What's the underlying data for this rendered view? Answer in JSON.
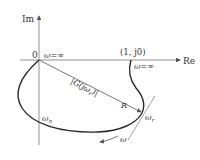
{
  "diagram": {
    "type": "nyquist-plot",
    "axes": {
      "imag_label": "Im",
      "real_label": "Re",
      "origin_label": "0"
    },
    "labels": {
      "omega_inf_origin": "ω=∞",
      "critical_point": "(1, j0)",
      "omega_inf_critical": "ω=∞",
      "magnitude": "|G(jω",
      "magnitude_sub": "r",
      "magnitude_close": ")|",
      "radius": "R",
      "omega_n": "ω",
      "omega_n_sub": "n",
      "omega_r": "ω",
      "omega_r_sub": "r",
      "omega_dir": "ω"
    },
    "colors": {
      "curve": "#2a2a2a",
      "axis": "#777777",
      "text": "#333333"
    }
  }
}
